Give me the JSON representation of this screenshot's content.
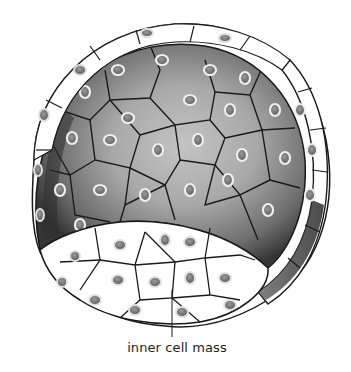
{
  "diagram": {
    "labels": [
      {
        "id": "inner-cell-mass",
        "text": "inner cell mass"
      }
    ],
    "colors": {
      "outline": "#1a1a1a",
      "outer_cell_fill": "#ffffff",
      "cavity_light": "#b8b8b8",
      "cavity_dark": "#3a3a3a",
      "nucleus_ring": "#f2f2f2",
      "nucleus_fill": "#7a7a7a"
    }
  }
}
